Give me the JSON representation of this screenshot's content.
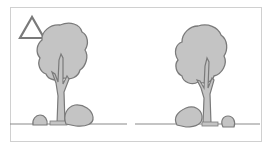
{
  "header": {
    "cropped_text": ""
  },
  "diagram": {
    "marker": {
      "shape": "triangle",
      "style": "outline"
    },
    "colors": {
      "fill": "#c4c4c4",
      "stroke": "#7a7a7a",
      "ground": "#8a8a8a",
      "frame": "#d0d0d0",
      "background": "#ffffff"
    },
    "trees": [
      {
        "id": "left",
        "shrubs": [
          "small-left",
          "large-right"
        ]
      },
      {
        "id": "right",
        "shrubs": [
          "large-left",
          "small-right"
        ]
      }
    ]
  }
}
